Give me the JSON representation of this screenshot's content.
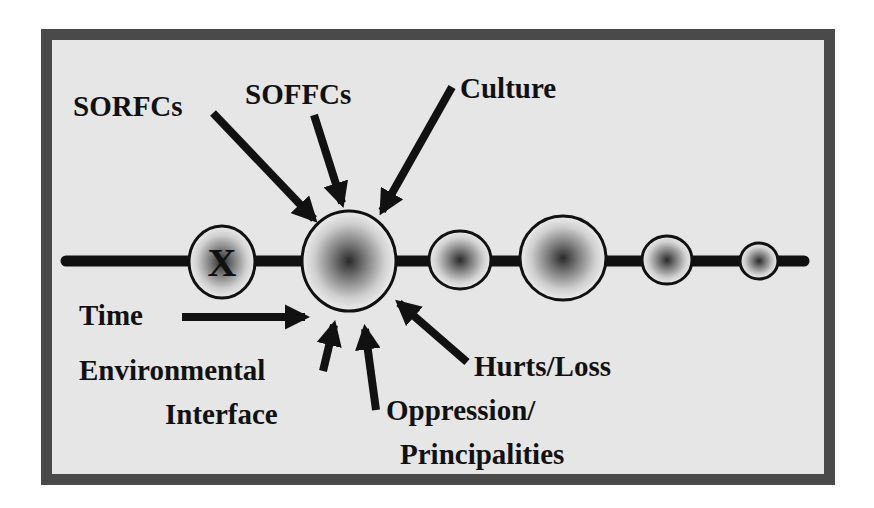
{
  "colors": {
    "frame_border": "#4a4a4a",
    "frame_fill": "#e6e6e6",
    "ink": "#111111",
    "node_center": "#2a2a2a",
    "node_edge": "#f2f2f2"
  },
  "diagram": {
    "timeline": {
      "nodes": [
        {
          "id": "x-node",
          "label": "X",
          "cx": 222,
          "cy": 262,
          "rx": 33,
          "ry": 36
        },
        {
          "id": "focal-node",
          "label": "",
          "cx": 349,
          "cy": 261,
          "rx": 47,
          "ry": 50
        },
        {
          "id": "node-3",
          "label": "",
          "cx": 448,
          "cy": 260,
          "rx": 31,
          "ry": 29
        },
        {
          "id": "node-4",
          "label": "",
          "cx": 543,
          "cy": 258,
          "rx": 43,
          "ry": 42
        },
        {
          "id": "node-5",
          "label": "",
          "cx": 641,
          "cy": 260,
          "rx": 25,
          "ry": 24
        },
        {
          "id": "node-6",
          "label": "",
          "cx": 726,
          "cy": 261,
          "rx": 19,
          "ry": 18
        }
      ]
    },
    "influences": {
      "sorfcs": "SORFCs",
      "soffcs": "SOFFCs",
      "culture": "Culture",
      "time": "Time",
      "environmental_line1": "Environmental",
      "environmental_line2": "Interface",
      "oppression_line1": "Oppression/",
      "oppression_line2": "Principalities",
      "hurts_loss": "Hurts/Loss"
    }
  }
}
